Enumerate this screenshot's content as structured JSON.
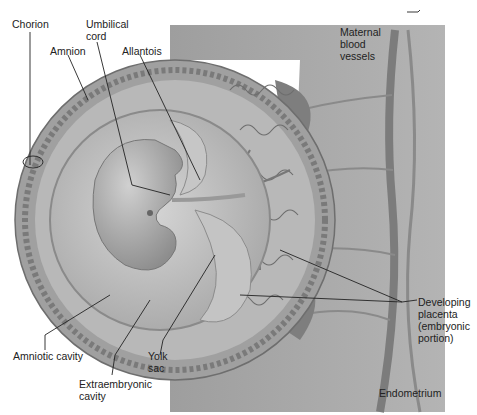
{
  "figure": {
    "type": "anatomical-diagram",
    "colors": {
      "endometrium": "#a9a9a9",
      "chorion_ring": "#9a9a9a",
      "amnion_fill": "#c8c8c8",
      "embryo": "#b5b5b5",
      "vessel": "#8a8a8a",
      "leader_line": "#222222",
      "label_text": "#222222"
    }
  },
  "labels": {
    "chorion": "Chorion",
    "amnion": "Amnion",
    "umbilical_cord": "Umbilical\ncord",
    "allantois": "Allantois",
    "maternal_blood_vessels": "Maternal\nblood\nvessels",
    "amniotic_cavity": "Amniotic cavity",
    "yolk_sac": "Yolk\nsac",
    "extraembryonic_cavity": "Extraembryonic\ncavity",
    "developing_placenta": "Developing\nplacenta\n(embryonic\nportion)",
    "endometrium": "Endometrium"
  }
}
